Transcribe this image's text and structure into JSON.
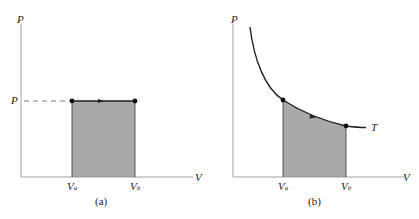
{
  "panels": [
    {
      "id": "a",
      "caption": "(a)",
      "y_axis_label": "P",
      "x_axis_label": "V",
      "pressure_label": "P",
      "va_label": "V",
      "va_sub": "a",
      "vb_label": "V",
      "vb_sub": "b",
      "process": "isobaric expansion at constant P from Va to Vb; shaded area = work"
    },
    {
      "id": "b",
      "caption": "(b)",
      "y_axis_label": "P",
      "x_axis_label": "V",
      "curve_label": "T",
      "va_label": "V",
      "va_sub": "a",
      "vb_label": "V",
      "vb_sub": "b",
      "process": "isothermal expansion along T curve from Va to Vb; shaded area = work"
    }
  ],
  "colors": {
    "line": "#222222",
    "fill": "#a9a9a9",
    "axis": "#888888"
  }
}
